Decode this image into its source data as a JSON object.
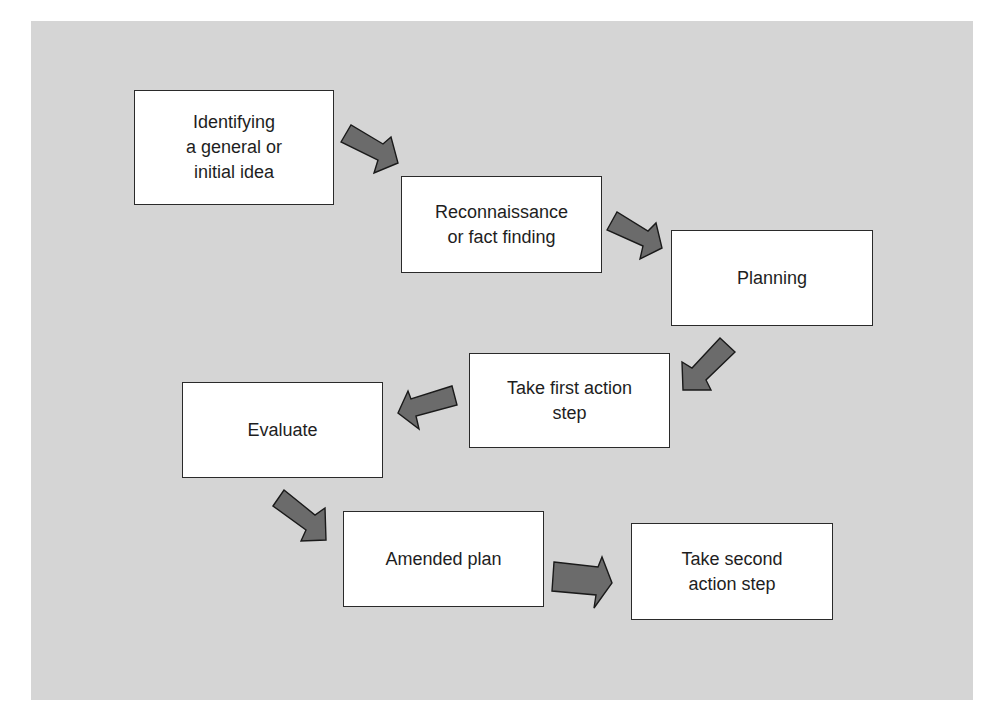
{
  "diagram": {
    "type": "flowchart",
    "background_color": "#d5d5d5",
    "arrow_color": "#6b6b6b",
    "steps": [
      {
        "id": "step1",
        "label": "Identifying\na general or\ninitial idea"
      },
      {
        "id": "step2",
        "label": "Reconnaissance\nor fact finding"
      },
      {
        "id": "step3",
        "label": "Planning"
      },
      {
        "id": "step4",
        "label": "Take first action\nstep"
      },
      {
        "id": "step5",
        "label": "Evaluate"
      },
      {
        "id": "step6",
        "label": "Amended plan"
      },
      {
        "id": "step7",
        "label": "Take second\naction step"
      }
    ],
    "connections": [
      {
        "from": "step1",
        "to": "step2",
        "direction": "down-right"
      },
      {
        "from": "step2",
        "to": "step3",
        "direction": "down-right"
      },
      {
        "from": "step3",
        "to": "step4",
        "direction": "down-left"
      },
      {
        "from": "step4",
        "to": "step5",
        "direction": "left"
      },
      {
        "from": "step5",
        "to": "step6",
        "direction": "down-right"
      },
      {
        "from": "step6",
        "to": "step7",
        "direction": "right"
      }
    ]
  }
}
